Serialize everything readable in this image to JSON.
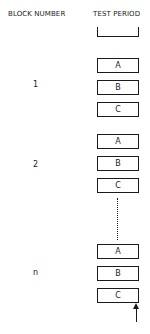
{
  "headers": {
    "block": "BLOCK NUMBER",
    "test": "TEST PERIOD"
  },
  "blocks": [
    {
      "label": "1",
      "periods": [
        "A",
        "B",
        "C"
      ]
    },
    {
      "label": "2",
      "periods": [
        "A",
        "B",
        "C"
      ]
    },
    {
      "label": "n",
      "periods": [
        "A",
        "B",
        "C"
      ]
    }
  ]
}
